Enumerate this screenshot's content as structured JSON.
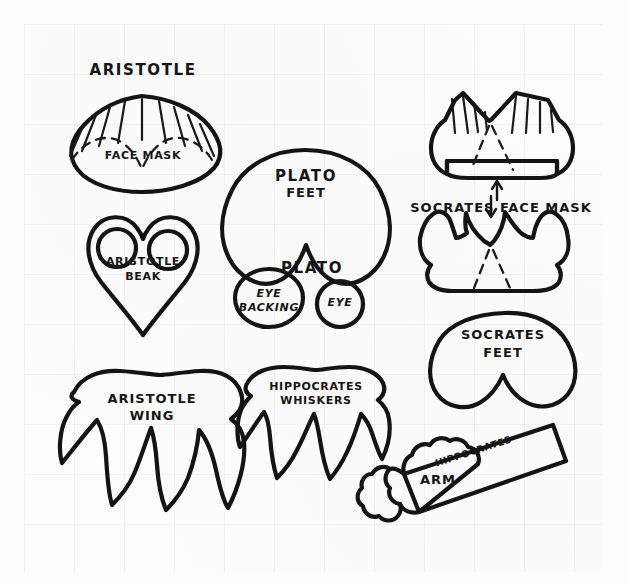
{
  "page": {
    "background_color": "#fdfdfd",
    "ink_color": "#141414",
    "grid_color": "#f0f0f0",
    "width": 627,
    "height": 585
  },
  "pieces": [
    {
      "id": "aristotle-face-mask",
      "heading": "ARISTOTLE",
      "inner_label": "FACE MASK",
      "shape": "rounded-fan-oval",
      "markings": [
        "radiating-slits",
        "dashed-scallop-line"
      ]
    },
    {
      "id": "aristotle-beak",
      "label_line1": "ARISTOTLE",
      "label_line2": "BEAK",
      "shape": "heart",
      "markings": [
        "two-eye-holes"
      ]
    },
    {
      "id": "aristotle-wing",
      "label_line1": "ARISTOTLE",
      "label_line2": "WING",
      "shape": "feathered-wing",
      "markings": []
    },
    {
      "id": "plato-feet",
      "label_line1": "PLATO",
      "label_line2": "FEET",
      "shape": "two-lobed-foot",
      "markings": []
    },
    {
      "id": "plato-eye-group",
      "heading": "PLATO",
      "parts": [
        {
          "id": "plato-eye-backing",
          "label_line1": "EYE",
          "label_line2": "BACKING",
          "shape": "circle"
        },
        {
          "id": "plato-eye",
          "label_line1": "EYE",
          "label_line2": "",
          "shape": "circle"
        }
      ]
    },
    {
      "id": "socrates-face-mask",
      "label": "SOCRATES  FACE MASK",
      "shape": "notched-band-with-slits",
      "markings": [
        "radiating-slits",
        "dashed-v-fold",
        "up-arrow"
      ]
    },
    {
      "id": "socrates-face-mask-alt",
      "label": "",
      "shape": "crown-notched-band",
      "markings": [
        "dashed-v-fold",
        "down-arrow"
      ]
    },
    {
      "id": "socrates-feet",
      "label_line1": "SOCRATES",
      "label_line2": "FEET",
      "shape": "two-lobed-foot",
      "markings": []
    },
    {
      "id": "hippocrates-whiskers",
      "label_line1": "HIPPOCRATES",
      "label_line2": "WHISKERS",
      "shape": "pointed-whisker-fringe",
      "markings": []
    },
    {
      "id": "hippocrates-arm",
      "label_line1": "HIPPOCRATES",
      "label_line2": "ARM",
      "shape": "diagonal-bar-with-cloud-hand",
      "markings": []
    }
  ]
}
